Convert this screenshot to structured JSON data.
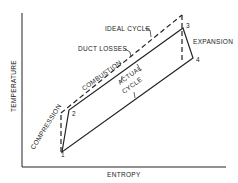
{
  "diagram": {
    "type": "temperature-entropy diagram",
    "xlabel": "ENTROPY",
    "ylabel": "TEMPERATURE",
    "points": {
      "p1": "1",
      "p2": "2",
      "p3": "3",
      "p4": "4"
    },
    "labels": {
      "ideal_cycle": "IDEAL CYCLE",
      "duct_losses": "DUCT LOSSES",
      "combustion": "COMBUSTION",
      "actual_cycle_line1": "ACTUAL",
      "actual_cycle_line2": "CYCLE",
      "expansion": "EXPANSION",
      "compression": "COMPRESSION"
    }
  }
}
